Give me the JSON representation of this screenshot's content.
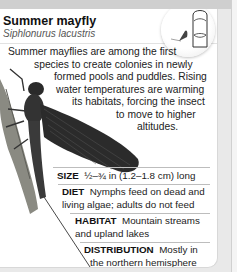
{
  "card": {
    "title": "Summer mayfly",
    "scientific_name": "Siphlonurus lacustris",
    "size_badge_icon": "fingertip-size-comparison-icon",
    "description_lines": [
      "Summer mayflies are among the first",
      "species to create colonies in newly",
      "formed pools and puddles. Rising",
      "water temperatures are warming",
      "its habitats, forcing the insect",
      "to move to higher",
      "altitudes."
    ],
    "facts": {
      "size": {
        "label": "SIZE",
        "lines": [
          "½–¾ in (1.2–1.8 cm) long"
        ]
      },
      "diet": {
        "label": "DIET",
        "lines": [
          "Nymphs feed on dead and",
          "living algae; adults do not feed"
        ]
      },
      "habitat": {
        "label": "HABITAT",
        "lines": [
          "Mountain streams",
          "and upland lakes"
        ]
      },
      "distribution": {
        "label": "DISTRIBUTION",
        "lines": [
          "Mostly in",
          "the northern hemisphere"
        ]
      }
    }
  }
}
